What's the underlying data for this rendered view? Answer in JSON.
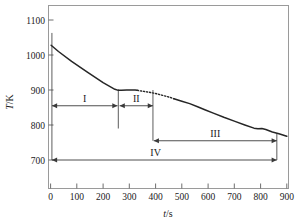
{
  "chart_data": {
    "type": "line",
    "title": "",
    "xlabel": "t/s",
    "ylabel": "T/K",
    "xlim": [
      0,
      900
    ],
    "ylim": [
      700,
      1100
    ],
    "xticks": [
      0,
      100,
      200,
      300,
      400,
      500,
      600,
      700,
      800,
      900
    ],
    "yticks": [
      700,
      800,
      900,
      1000,
      1100
    ],
    "grid": false,
    "legend": null,
    "series": [
      {
        "name": "cooling curve (solid)",
        "style": "solid",
        "x": [
          2,
          30,
          80,
          140,
          200,
          245,
          258,
          270,
          290,
          310,
          322,
          330
        ],
        "y": [
          1028,
          1010,
          982,
          951,
          921,
          902,
          899,
          899,
          900,
          900,
          900,
          899
        ]
      },
      {
        "name": "cooling curve (dotted interpolation)",
        "style": "dotted",
        "x": [
          330,
          355,
          380,
          405,
          430,
          455,
          470
        ],
        "y": [
          899,
          896,
          893,
          889,
          884,
          879,
          875
        ]
      },
      {
        "name": "cooling curve (solid, lower branch)",
        "style": "solid",
        "x": [
          470,
          500,
          530,
          560,
          590,
          620,
          660,
          700,
          740,
          775,
          790,
          805,
          820,
          845,
          870,
          900
        ],
        "y": [
          875,
          868,
          861,
          852,
          843,
          834,
          822,
          811,
          800,
          791,
          789,
          790,
          787,
          780,
          775,
          768
        ]
      }
    ],
    "annotations": [
      {
        "name": "region-I",
        "label": "I",
        "type": "double-arrow",
        "x_start": 5,
        "x_end": 255,
        "y": 855
      },
      {
        "name": "region-II",
        "label": "II",
        "type": "double-arrow",
        "x_start": 263,
        "x_end": 390,
        "y": 855
      },
      {
        "name": "region-III",
        "label": "III",
        "type": "double-arrow",
        "x_start": 393,
        "x_end": 862,
        "y": 755
      },
      {
        "name": "region-IV",
        "label": "IV",
        "type": "double-arrow",
        "x_start": 5,
        "x_end": 862,
        "y": 700
      },
      {
        "name": "boundary-I-II",
        "type": "vline",
        "x": 258,
        "y_top": 902,
        "y_bottom": 790
      },
      {
        "name": "boundary-II-III",
        "type": "vline",
        "x": 390,
        "y_top": 900,
        "y_bottom": 755
      },
      {
        "name": "boundary-start",
        "type": "vline",
        "x": 5,
        "y_top": 1063,
        "y_bottom": 700
      },
      {
        "name": "boundary-end",
        "type": "vline",
        "x": 862,
        "y_top": 775,
        "y_bottom": 700
      }
    ]
  },
  "axes": {
    "y_title": "T/K",
    "y_title_italic": "T",
    "y_title_rest": "/K",
    "x_title": "t/s",
    "x_title_italic": "t",
    "x_title_rest": "/s",
    "ytick_labels": [
      "1100",
      "1000",
      "900",
      "800",
      "700"
    ],
    "xtick_labels": [
      "0",
      "100",
      "200",
      "300",
      "400",
      "500",
      "600",
      "700",
      "800",
      "900"
    ]
  },
  "regions": {
    "I": "I",
    "II": "II",
    "III": "III",
    "IV": "IV"
  },
  "colors": {
    "curve": "#262626",
    "frame": "#9a9a9a",
    "annotation": "#3a3a3a",
    "text": "#1a1a1a",
    "background": "#ffffff"
  }
}
